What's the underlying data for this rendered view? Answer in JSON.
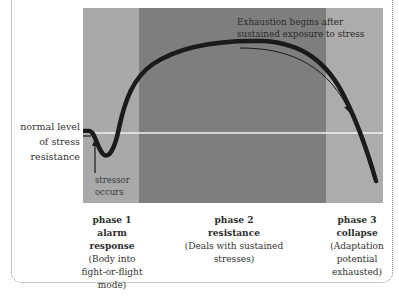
{
  "diagram": {
    "y_axis_label": "normal level of stress resistance",
    "y_axis_lines": [
      "normal level",
      "of stress",
      "resistance"
    ],
    "annotations": {
      "stressor": [
        "stressor",
        "occurs"
      ],
      "exhaustion": [
        "Exhaustion begins after",
        "sustained exposure to stress"
      ]
    },
    "phases": [
      {
        "number": "phase 1",
        "name": [
          "alarm",
          "response"
        ],
        "desc": [
          "(Body into",
          "fight-or-flight",
          "mode)"
        ],
        "shade": "#a9a9a9"
      },
      {
        "number": "phase 2",
        "name": [
          "resistance"
        ],
        "desc": [
          "(Deals with sustained",
          "stresses)"
        ],
        "shade": "#7e7e7e"
      },
      {
        "number": "phase 3",
        "name": [
          "collapse"
        ],
        "desc": [
          "(Adaptation",
          "potential",
          "exhausted)"
        ],
        "shade": "#acacac"
      }
    ],
    "colors": {
      "curve": "#1a1a1a",
      "baseline": "#f2f2f2",
      "border": "#8a8a8a"
    }
  }
}
